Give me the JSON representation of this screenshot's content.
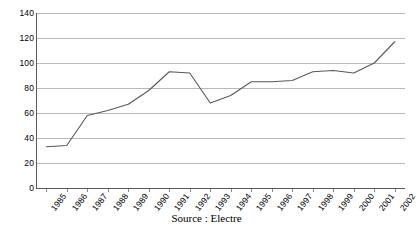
{
  "caption": "Source : Electre",
  "chart_data": {
    "type": "line",
    "title": "",
    "subtitle": "",
    "xlabel": "",
    "ylabel": "",
    "categories": [
      "1985",
      "1986",
      "1987",
      "1988",
      "1989",
      "1990",
      "1991",
      "1992",
      "1993",
      "1994",
      "1995",
      "1996",
      "1997",
      "1998",
      "1999",
      "2000",
      "2001",
      "2002"
    ],
    "values": [
      33,
      34,
      58,
      62,
      67,
      78,
      93,
      92,
      68,
      74,
      85,
      85,
      86,
      93,
      94,
      92,
      100,
      117
    ],
    "series": [
      {
        "name": "",
        "values": [
          33,
          34,
          58,
          62,
          67,
          78,
          93,
          92,
          68,
          74,
          85,
          85,
          86,
          93,
          94,
          92,
          100,
          117
        ]
      }
    ],
    "ylim": [
      0,
      140
    ],
    "yticks": [
      0,
      20,
      40,
      60,
      80,
      100,
      120,
      140
    ],
    "ytick_labels": [
      "0",
      "20",
      "40",
      "60",
      "80",
      "100",
      "120",
      "140"
    ],
    "grid": true,
    "grid_axis": "y",
    "legend": false,
    "legend_position": "none",
    "line_color": "#595959",
    "grid_color": "#b8b8b8",
    "axis_color": "#5a5a5a",
    "background_color": "#ffffff",
    "xtick_rotation": -52
  }
}
